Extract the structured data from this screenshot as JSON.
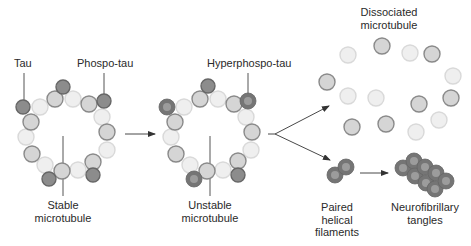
{
  "labels": {
    "tau": "Tau",
    "phospho_tau": "Phospo-tau",
    "hyperphospho_tau": "Hyperphospo-tau",
    "stable": [
      "Stable",
      "microtubule"
    ],
    "unstable": [
      "Unstable",
      "microtubule"
    ],
    "dissociated": [
      "Dissociated",
      "microtubule"
    ],
    "paired": [
      "Paired",
      "helical",
      "filaments"
    ],
    "tangles": [
      "Neurofibrillary",
      "tangles"
    ]
  },
  "colors": {
    "light_fill": "#efefef",
    "light_stroke": "#d9d9d9",
    "medium_fill": "#d5d5d5",
    "medium_stroke": "#8a8a8a",
    "dark_fill": "#8c8c8c",
    "dark_stroke": "#666666",
    "hyper_outer": "#757575",
    "hyper_inner": "#9c9c9c",
    "line": "#555555",
    "arrow": "#333333"
  },
  "circles": {
    "stable": [
      {
        "x": 40,
        "y": 107,
        "t": "light"
      },
      {
        "x": 55,
        "y": 99,
        "t": "medium"
      },
      {
        "x": 73,
        "y": 99,
        "t": "light"
      },
      {
        "x": 89,
        "y": 104,
        "t": "medium"
      },
      {
        "x": 102,
        "y": 117,
        "t": "light"
      },
      {
        "x": 107,
        "y": 132,
        "t": "medium"
      },
      {
        "x": 107,
        "y": 150,
        "t": "light"
      },
      {
        "x": 93,
        "y": 162,
        "t": "medium"
      },
      {
        "x": 78,
        "y": 170,
        "t": "light"
      },
      {
        "x": 62,
        "y": 171,
        "t": "medium"
      },
      {
        "x": 45,
        "y": 165,
        "t": "light"
      },
      {
        "x": 32,
        "y": 154,
        "t": "medium"
      },
      {
        "x": 26,
        "y": 137,
        "t": "light"
      },
      {
        "x": 31,
        "y": 122,
        "t": "medium"
      },
      {
        "x": 63,
        "y": 87,
        "t": "dark"
      },
      {
        "x": 23,
        "y": 107,
        "t": "dark"
      },
      {
        "x": 104,
        "y": 101,
        "t": "dark"
      },
      {
        "x": 49,
        "y": 179,
        "t": "dark"
      },
      {
        "x": 93,
        "y": 175,
        "t": "dark"
      }
    ],
    "unstable": [
      {
        "x": 184,
        "y": 107,
        "t": "light"
      },
      {
        "x": 200,
        "y": 99,
        "t": "medium"
      },
      {
        "x": 218,
        "y": 99,
        "t": "light"
      },
      {
        "x": 234,
        "y": 104,
        "t": "medium"
      },
      {
        "x": 246,
        "y": 117,
        "t": "light"
      },
      {
        "x": 252,
        "y": 132,
        "t": "medium"
      },
      {
        "x": 251,
        "y": 150,
        "t": "light"
      },
      {
        "x": 238,
        "y": 161,
        "t": "medium"
      },
      {
        "x": 223,
        "y": 170,
        "t": "light"
      },
      {
        "x": 207,
        "y": 171,
        "t": "medium"
      },
      {
        "x": 190,
        "y": 165,
        "t": "light"
      },
      {
        "x": 176,
        "y": 154,
        "t": "medium"
      },
      {
        "x": 171,
        "y": 137,
        "t": "light"
      },
      {
        "x": 175,
        "y": 122,
        "t": "medium"
      },
      {
        "x": 208,
        "y": 86,
        "t": "dark"
      },
      {
        "x": 167,
        "y": 107,
        "t": "hyper"
      },
      {
        "x": 248,
        "y": 101,
        "t": "hyper"
      },
      {
        "x": 194,
        "y": 179,
        "t": "hyper"
      },
      {
        "x": 238,
        "y": 175,
        "t": "dark"
      }
    ],
    "dissociated": [
      {
        "x": 348,
        "y": 55,
        "t": "light"
      },
      {
        "x": 382,
        "y": 46,
        "t": "medium"
      },
      {
        "x": 410,
        "y": 53,
        "t": "light"
      },
      {
        "x": 432,
        "y": 54,
        "t": "medium"
      },
      {
        "x": 453,
        "y": 76,
        "t": "light"
      },
      {
        "x": 327,
        "y": 82,
        "t": "medium"
      },
      {
        "x": 348,
        "y": 96,
        "t": "light"
      },
      {
        "x": 376,
        "y": 98,
        "t": "light"
      },
      {
        "x": 419,
        "y": 104,
        "t": "medium"
      },
      {
        "x": 451,
        "y": 98,
        "t": "medium"
      },
      {
        "x": 439,
        "y": 120,
        "t": "light"
      },
      {
        "x": 352,
        "y": 127,
        "t": "medium"
      },
      {
        "x": 386,
        "y": 124,
        "t": "medium"
      },
      {
        "x": 416,
        "y": 132,
        "t": "light"
      }
    ],
    "paired": [
      {
        "x": 335,
        "y": 175,
        "t": "hyper"
      },
      {
        "x": 346,
        "y": 167,
        "t": "hyper"
      }
    ],
    "tangles": [
      {
        "x": 403,
        "y": 168,
        "t": "hyper"
      },
      {
        "x": 414,
        "y": 161,
        "t": "hyper"
      },
      {
        "x": 415,
        "y": 176,
        "t": "hyper"
      },
      {
        "x": 425,
        "y": 167,
        "t": "hyper"
      },
      {
        "x": 426,
        "y": 183,
        "t": "hyper"
      },
      {
        "x": 436,
        "y": 173,
        "t": "hyper"
      },
      {
        "x": 435,
        "y": 189,
        "t": "hyper"
      },
      {
        "x": 446,
        "y": 181,
        "t": "hyper"
      }
    ]
  },
  "leader_lines": [
    {
      "x1": 24,
      "y1": 73,
      "x2": 24,
      "y2": 100
    },
    {
      "x1": 104,
      "y1": 73,
      "x2": 104,
      "y2": 94
    },
    {
      "x1": 248,
      "y1": 73,
      "x2": 248,
      "y2": 94
    },
    {
      "x1": 63,
      "y1": 136,
      "x2": 63,
      "y2": 196
    },
    {
      "x1": 210,
      "y1": 136,
      "x2": 210,
      "y2": 196
    }
  ],
  "arrows": [
    {
      "x1": 125,
      "y1": 134,
      "x2": 155,
      "y2": 134
    },
    {
      "x1": 275,
      "y1": 134,
      "x2": 329,
      "y2": 106
    },
    {
      "x1": 275,
      "y1": 134,
      "x2": 330,
      "y2": 160
    },
    {
      "x1": 360,
      "y1": 173,
      "x2": 388,
      "y2": 173
    }
  ],
  "stems": [
    {
      "x1": 268,
      "y1": 134,
      "x2": 275,
      "y2": 134
    }
  ]
}
